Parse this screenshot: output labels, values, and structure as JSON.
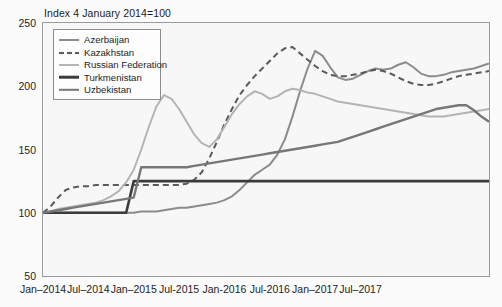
{
  "chart_data": {
    "type": "line",
    "title": "Index 4 January 2014=100",
    "xlabel": "",
    "ylabel": "",
    "ylim": [
      50,
      250
    ],
    "yticks": [
      50,
      100,
      150,
      200,
      250
    ],
    "xticks": [
      "Jan–2014",
      "Jul–2014",
      "Jan–2015",
      "Jul-2015",
      "Jan-2016",
      "Jul-2016",
      "Jan–2017",
      "Jul–2017"
    ],
    "grid": false,
    "legend_position": "top-left",
    "x_start": "Jan-2014",
    "x_end": "Dec-2017",
    "x_unit": "month",
    "series": [
      {
        "name": "Azerbaijan",
        "color": "#8c8c8c",
        "style": "solid",
        "width": 2.0,
        "values": [
          100,
          100,
          100,
          100,
          100,
          100,
          100,
          100,
          100,
          100,
          100,
          100,
          100,
          101,
          101,
          101,
          102,
          103,
          104,
          104,
          105,
          106,
          107,
          108,
          110,
          113,
          118,
          124,
          130,
          134,
          138,
          146,
          158,
          176,
          196,
          214,
          228,
          224,
          215,
          207,
          205,
          206,
          209,
          212,
          214,
          213,
          214,
          217,
          219,
          215,
          210,
          208,
          208,
          209,
          211,
          212,
          213,
          214,
          216,
          218
        ]
      },
      {
        "name": "Kazakhstan",
        "color": "#5a5a5a",
        "style": "dashed",
        "width": 2.0,
        "values": [
          100,
          105,
          112,
          118,
          120,
          121,
          121,
          122,
          122,
          122,
          122,
          122,
          122,
          122,
          122,
          122,
          122,
          122,
          122,
          123,
          126,
          132,
          143,
          156,
          170,
          182,
          193,
          201,
          208,
          214,
          220,
          226,
          230,
          231,
          226,
          221,
          216,
          212,
          209,
          208,
          208,
          209,
          210,
          212,
          213,
          212,
          210,
          207,
          204,
          202,
          201,
          201,
          202,
          204,
          206,
          208,
          209,
          210,
          211,
          212
        ]
      },
      {
        "name": "Russian Federation",
        "color": "#b4b4b4",
        "style": "solid",
        "width": 2.0,
        "values": [
          100,
          101,
          103,
          104,
          105,
          106,
          107,
          108,
          110,
          113,
          117,
          124,
          134,
          150,
          168,
          184,
          193,
          190,
          182,
          172,
          162,
          155,
          152,
          158,
          168,
          178,
          186,
          192,
          196,
          194,
          190,
          192,
          196,
          198,
          197,
          195,
          194,
          192,
          190,
          188,
          187,
          186,
          185,
          184,
          183,
          182,
          181,
          180,
          179,
          178,
          177,
          176,
          176,
          176,
          177,
          178,
          179,
          180,
          181,
          182
        ]
      },
      {
        "name": "Turkmenistan",
        "color": "#3b3b3b",
        "style": "solid",
        "width": 2.6,
        "values": [
          100,
          100,
          100,
          100,
          100,
          100,
          100,
          100,
          100,
          100,
          100,
          100,
          125,
          125,
          125,
          125,
          125,
          125,
          125,
          125,
          125,
          125,
          125,
          125,
          125,
          125,
          125,
          125,
          125,
          125,
          125,
          125,
          125,
          125,
          125,
          125,
          125,
          125,
          125,
          125,
          125,
          125,
          125,
          125,
          125,
          125,
          125,
          125,
          125,
          125,
          125,
          125,
          125,
          125,
          125,
          125,
          125,
          125,
          125,
          125
        ]
      },
      {
        "name": "Uzbekistan",
        "color": "#777777",
        "style": "solid",
        "width": 2.4,
        "values": [
          100,
          101,
          102,
          103,
          104,
          105,
          106,
          107,
          108,
          109,
          110,
          111,
          112,
          136,
          136,
          136,
          136,
          136,
          136,
          136,
          137,
          138,
          139,
          140,
          141,
          142,
          143,
          144,
          145,
          146,
          147,
          148,
          149,
          150,
          151,
          152,
          153,
          154,
          155,
          156,
          158,
          160,
          162,
          164,
          166,
          168,
          170,
          172,
          174,
          176,
          178,
          180,
          182,
          183,
          184,
          185,
          185,
          181,
          176,
          172
        ]
      }
    ]
  },
  "legend": {
    "items": [
      {
        "label": "Azerbaijan"
      },
      {
        "label": "Kazakhstan"
      },
      {
        "label": "Russian Federation"
      },
      {
        "label": "Turkmenistan"
      },
      {
        "label": "Uzbekistan"
      }
    ]
  }
}
